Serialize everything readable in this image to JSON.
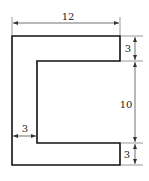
{
  "figure": {
    "shape": "C-shaped cross-section",
    "dimensions": {
      "width_top": "12",
      "flange_top_thickness": "3",
      "web_height": "10",
      "flange_bottom_thickness": "3",
      "web_thickness": "3"
    }
  },
  "colors": {
    "stroke": "#111111",
    "dim": "#333333"
  }
}
